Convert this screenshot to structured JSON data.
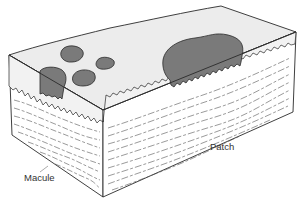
{
  "figure": {
    "labels": {
      "macule": "Macule",
      "patch": "Patch"
    },
    "colors": {
      "lesion_fill": "#7a7a7a",
      "surface_fill": "#ececec",
      "epidermis_fill": "#f2f2f2",
      "dermis_fill": "#ffffff",
      "outline": "#2a2a2a",
      "fiber_lines": "#555555"
    }
  }
}
